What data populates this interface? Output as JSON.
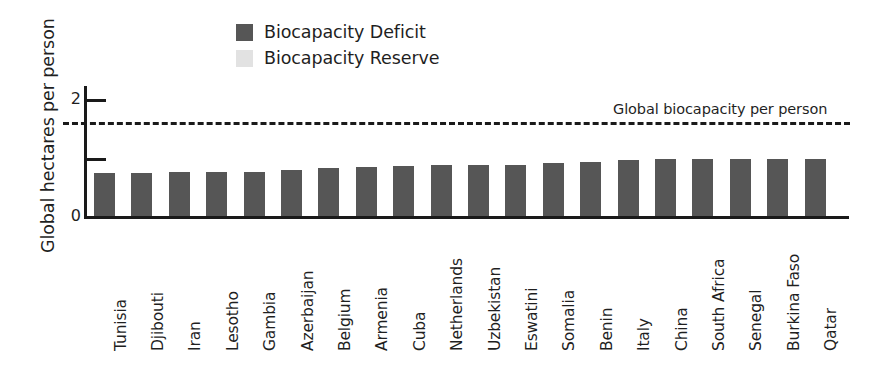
{
  "chart_data": {
    "type": "bar",
    "title": "",
    "xlabel": "",
    "ylabel": "Global hectares per person",
    "ylim": [
      0,
      2.2
    ],
    "yticks": [
      0,
      1,
      2
    ],
    "ytick_labels": [
      "0",
      "",
      "2"
    ],
    "grid": false,
    "legend_position": "top-center",
    "categories": [
      "Tunisia",
      "Djibouti",
      "Iran",
      "Lesotho",
      "Gambia",
      "Azerbaijan",
      "Belgium",
      "Armenia",
      "Cuba",
      "Netherlands",
      "Uzbekistan",
      "Eswatini",
      "Somalia",
      "Benin",
      "Italy",
      "China",
      "South Africa",
      "Senegal",
      "Burkina Faso",
      "Qatar"
    ],
    "series": [
      {
        "name": "Biocapacity Deficit",
        "color": "#565656",
        "values": [
          0.73,
          0.74,
          0.75,
          0.75,
          0.76,
          0.79,
          0.82,
          0.83,
          0.85,
          0.87,
          0.88,
          0.88,
          0.9,
          0.92,
          0.95,
          0.97,
          0.97,
          0.97,
          0.98,
          0.98
        ]
      },
      {
        "name": "Biocapacity Reserve",
        "color": "#e2e2e2",
        "values": [
          0,
          0,
          0,
          0,
          0,
          0,
          0,
          0,
          0,
          0,
          0,
          0,
          0,
          0,
          0,
          0,
          0,
          0,
          0,
          0
        ]
      }
    ],
    "annotations": [
      {
        "name": "global-biocapacity-threshold",
        "label": "Global biocapacity per person",
        "value": 1.6,
        "style": "dashed-horizontal-line"
      }
    ]
  },
  "legend": {
    "items": [
      {
        "label": "Biocapacity Deficit",
        "color": "#565656",
        "swatch_name": "legend-swatch-deficit"
      },
      {
        "label": "Biocapacity Reserve",
        "color": "#e2e2e2",
        "swatch_name": "legend-swatch-reserve"
      }
    ]
  },
  "axis": {
    "y_title": "Global hectares per person",
    "y_label_top": "2",
    "y_label_bottom": "0"
  },
  "annotation": {
    "threshold_label": "Global biocapacity per person"
  }
}
